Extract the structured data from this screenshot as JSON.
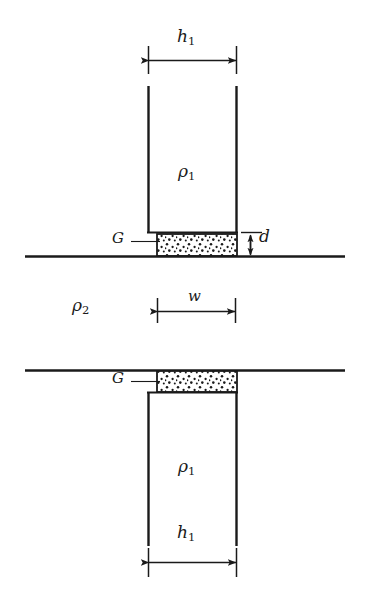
{
  "figure": {
    "type": "technical-diagram",
    "background_color": "#ffffff",
    "ink_color": "#1a1a1a"
  },
  "labels": {
    "h1_top": {
      "text": "h",
      "subscript": "1"
    },
    "h1_bottom": {
      "text": "h",
      "subscript": "1"
    },
    "rho1_top": {
      "text": "ρ",
      "subscript": "1"
    },
    "rho1_bottom": {
      "text": "ρ",
      "subscript": "1"
    },
    "rho2": {
      "text": "ρ",
      "subscript": "2"
    },
    "w": {
      "text": "w"
    },
    "d": {
      "text": "d"
    },
    "g_top": {
      "text": "G"
    },
    "g_bottom": {
      "text": "G"
    }
  },
  "dimensions": [
    {
      "name": "h1-top",
      "label": "h1",
      "orientation": "horizontal",
      "x_start": 148,
      "x_end": 237,
      "y": 60
    },
    {
      "name": "w",
      "label": "w",
      "orientation": "horizontal",
      "x_start": 157,
      "x_end": 236,
      "y": 311
    },
    {
      "name": "d",
      "label": "d",
      "orientation": "vertical",
      "x": 250,
      "y_start": 233,
      "y_end": 256
    },
    {
      "name": "h1-bottom",
      "label": "h1",
      "orientation": "horizontal",
      "x_start": 148,
      "x_end": 237,
      "y": 562
    }
  ],
  "shapes": {
    "top_block": {
      "left": 148,
      "right": 237,
      "top": 86,
      "bottom": 232,
      "fill": "none"
    },
    "top_stipple": {
      "left": 157,
      "right": 237,
      "top": 234,
      "bottom": 256,
      "fill": "stipple"
    },
    "bottom_stipple": {
      "left": 157,
      "right": 237,
      "top": 370,
      "bottom": 392,
      "fill": "stipple"
    },
    "bottom_block": {
      "left": 148,
      "right": 237,
      "top": 392,
      "bottom": 545,
      "fill": "none"
    },
    "ground_line_upper": {
      "x_start": 25,
      "x_end": 345,
      "y": 256
    },
    "ground_line_lower": {
      "x_start": 25,
      "x_end": 345,
      "y": 370
    }
  }
}
